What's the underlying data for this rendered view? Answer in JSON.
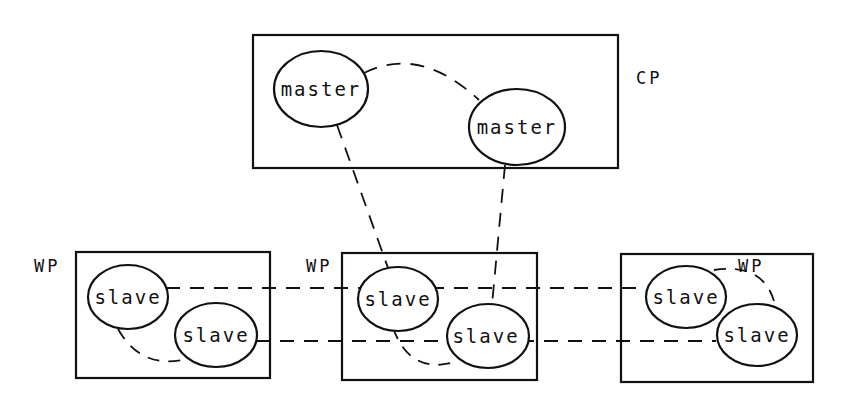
{
  "diagram": {
    "processors": {
      "cp": {
        "label": "CP",
        "nodes": [
          "master",
          "master"
        ]
      },
      "wp1": {
        "label": "WP",
        "nodes": [
          "slave",
          "slave"
        ]
      },
      "wp2": {
        "label": "WP",
        "nodes": [
          "slave",
          "slave"
        ]
      },
      "wp3": {
        "label": "WP",
        "nodes": [
          "slave",
          "slave"
        ]
      }
    },
    "connections": [
      "cp.master1 -- cp.master2",
      "cp.master1 -- wp2.slave1",
      "cp.master2 -- wp2.slave2",
      "wp1.slave1 -- wp2.slave1 -- wp3.slave1",
      "wp1.slave2 -- wp2.slave2 -- wp3.slave2",
      "wp1.slave1 -- wp1.slave2",
      "wp2.slave1 -- wp2.slave2",
      "wp3.slave1 -- wp3.slave2"
    ],
    "line_style": "dashed",
    "colors": {
      "ink": "#111111",
      "background": "#ffffff"
    }
  }
}
